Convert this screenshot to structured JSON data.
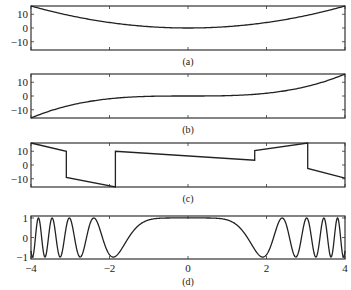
{
  "chart_data": [
    {
      "id": "a",
      "type": "line",
      "caption": "(a)",
      "xlim": [
        -4,
        4
      ],
      "ylim": [
        -16,
        16
      ],
      "yticks": [
        -10,
        0,
        10
      ],
      "ytick_labels": [
        "−10",
        "0",
        "10"
      ],
      "xticks": [
        -4,
        -2,
        0,
        2,
        4
      ],
      "xtick_labels_shown": false,
      "x": [
        -4,
        -3,
        -2,
        -1,
        0,
        1,
        2,
        3,
        4
      ],
      "y": [
        16,
        9,
        4,
        1,
        0,
        1,
        4,
        9,
        16
      ]
    },
    {
      "id": "b",
      "type": "line",
      "caption": "(b)",
      "xlim": [
        -4,
        4
      ],
      "ylim": [
        -16,
        16
      ],
      "yticks": [
        -10,
        0,
        10
      ],
      "ytick_labels": [
        "−10",
        "0",
        "10"
      ],
      "xticks": [
        -4,
        -2,
        0,
        2,
        4
      ],
      "xtick_labels_shown": false,
      "x": [
        -4,
        -3,
        -2,
        -1,
        0,
        1,
        2,
        3,
        4
      ],
      "y": [
        -16,
        -9,
        -4,
        -1,
        0,
        1,
        4,
        9,
        16
      ]
    },
    {
      "id": "c",
      "type": "line",
      "caption": "(c)",
      "xlim": [
        -4,
        4
      ],
      "ylim": [
        -16,
        16
      ],
      "yticks": [
        -10,
        0,
        10
      ],
      "ytick_labels": [
        "−10",
        "0",
        "10"
      ],
      "xticks": [
        -4,
        -2,
        0,
        2,
        4
      ],
      "xtick_labels_shown": false,
      "segments": [
        {
          "x": [
            -4,
            -3.1
          ],
          "y": [
            16,
            10
          ]
        },
        {
          "x": [
            -3.1,
            -3.1
          ],
          "y": [
            10,
            -9
          ]
        },
        {
          "x": [
            -3.1,
            -1.85
          ],
          "y": [
            -9,
            -16
          ]
        },
        {
          "x": [
            -1.85,
            -1.85
          ],
          "y": [
            -16,
            10
          ]
        },
        {
          "x": [
            -1.85,
            1.7
          ],
          "y": [
            10,
            3.5
          ]
        },
        {
          "x": [
            1.7,
            1.7
          ],
          "y": [
            3.5,
            10.5
          ]
        },
        {
          "x": [
            1.7,
            3.05
          ],
          "y": [
            10.5,
            16
          ]
        },
        {
          "x": [
            3.05,
            3.05
          ],
          "y": [
            16,
            -2.5
          ]
        },
        {
          "x": [
            3.05,
            4
          ],
          "y": [
            -2.5,
            -9.5
          ]
        }
      ]
    },
    {
      "id": "d",
      "type": "line",
      "caption": "(d)",
      "xlim": [
        -4,
        4
      ],
      "ylim": [
        -1.1,
        1.1
      ],
      "yticks": [
        -1,
        0,
        1
      ],
      "ytick_labels": [
        "−1",
        "0",
        "1"
      ],
      "xticks": [
        -4,
        -2,
        0,
        2,
        4
      ],
      "xtick_labels": [
        "−4",
        "−2",
        "0",
        "2",
        "4"
      ],
      "xtick_labels_shown": true,
      "function": "cos(x^3)",
      "approx_extrema": [
        {
          "x": -3.6,
          "y": 1
        },
        {
          "x": -3.1,
          "y": -1
        },
        {
          "x": -2.5,
          "y": 1
        },
        {
          "x": -1.85,
          "y": -1
        },
        {
          "x": 0,
          "y": 1
        },
        {
          "x": 1.75,
          "y": -1
        },
        {
          "x": 2.5,
          "y": 1
        },
        {
          "x": 3.1,
          "y": -1
        },
        {
          "x": 3.55,
          "y": 1
        }
      ]
    }
  ]
}
